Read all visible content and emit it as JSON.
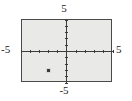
{
  "chart_data": {
    "type": "scatter",
    "title": "",
    "subtitle": "",
    "xlabel": "",
    "ylabel": "",
    "xlim": [
      -5,
      5
    ],
    "ylim": [
      -5,
      5
    ],
    "grid": false,
    "legend": false,
    "axis_labels": {
      "top": "5",
      "bottom": "-5",
      "left": "-5",
      "right": "5"
    },
    "x_tick_values": [
      -5,
      -4,
      -3,
      -2,
      -1,
      1,
      2,
      3,
      4,
      5
    ],
    "y_tick_values": [
      -5,
      -4,
      -3,
      -2,
      -1,
      1,
      2,
      3,
      4,
      5
    ],
    "x_tick_labels": [
      "-5",
      "5"
    ],
    "y_tick_labels": [
      "-5",
      "5"
    ],
    "points": [
      {
        "label": "plotted-point",
        "x": -2,
        "y": -3
      }
    ],
    "series": [
      {
        "name": "point",
        "x": [
          -2
        ],
        "y": [
          -3
        ]
      }
    ],
    "colors": {
      "plot_background": "#e9e9e7",
      "frame": "#4a4a4a",
      "axis": "#3c3c3c",
      "point": "#3a3a3a",
      "text": "#1a1a1a",
      "page_background": "#ffffff"
    }
  }
}
